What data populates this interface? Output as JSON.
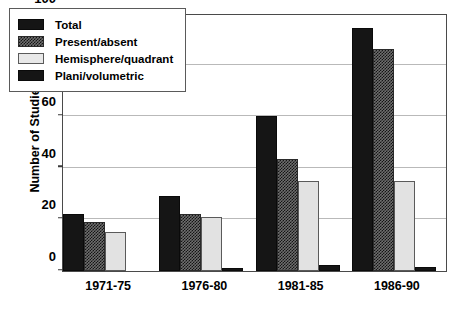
{
  "chart_data": {
    "type": "bar",
    "title": "",
    "xlabel": "",
    "ylabel": "Number of Studies",
    "ylim": [
      0,
      100
    ],
    "yticks": [
      0,
      20,
      40,
      60,
      80,
      100
    ],
    "gridlines": [
      20,
      40,
      60,
      80
    ],
    "grid": true,
    "legend_position": "upper left",
    "categories": [
      "1971-75",
      "1976-80",
      "1981-85",
      "1986-90"
    ],
    "series": [
      {
        "name": "Total",
        "key": "total",
        "values": [
          22,
          29,
          60,
          94
        ]
      },
      {
        "name": "Present/absent",
        "key": "present",
        "values": [
          19,
          22,
          43.5,
          86
        ]
      },
      {
        "name": "Hemisphere/quadrant",
        "key": "hemi",
        "values": [
          15,
          21,
          35,
          35
        ]
      },
      {
        "name": "Plani/volumetric",
        "key": "plani",
        "values": [
          0,
          1,
          2.5,
          1.5
        ]
      }
    ]
  }
}
